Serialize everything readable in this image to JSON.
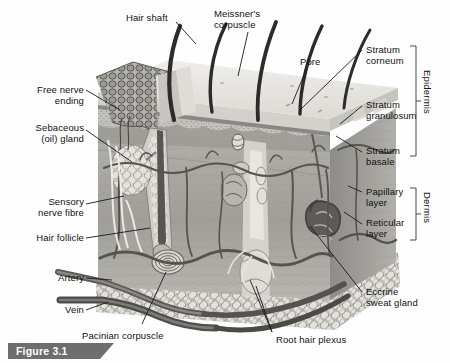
{
  "figure": {
    "caption": "Figure 3.1",
    "style": "grayscale anatomical illustration"
  },
  "colors": {
    "background": "#fefefe",
    "ink": "#1a1a1a",
    "caption_bar": "#6e6e6e",
    "caption_text": "#ffffff",
    "epidermis_top": "#e8e6e2",
    "epidermis_mid": "#b9b7b2",
    "epidermis_dark": "#8e8c88",
    "dermis": "#a8a6a1",
    "dermis_light": "#c9c7c2",
    "hypodermis": "#d6d4cf",
    "vessel_dark": "#5a5854",
    "hair": "#2e2c2a"
  },
  "labels_left": [
    {
      "id": "free-nerve-ending",
      "text": "Free nerve\nending",
      "x": 12,
      "y": 86,
      "w": 72
    },
    {
      "id": "sebaceous-gland",
      "text": "Sebaceous\n(oil) gland",
      "x": 8,
      "y": 124,
      "w": 76
    },
    {
      "id": "sensory-nerve-fibre",
      "text": "Sensory\nnerve fibre",
      "x": 8,
      "y": 198,
      "w": 76
    },
    {
      "id": "hair-follicle",
      "text": "Hair follicle",
      "x": 8,
      "y": 232,
      "w": 76
    },
    {
      "id": "artery",
      "text": "Artery",
      "x": 18,
      "y": 272,
      "w": 66
    },
    {
      "id": "vein",
      "text": "Vein",
      "x": 28,
      "y": 304,
      "w": 56
    }
  ],
  "labels_top": [
    {
      "id": "hair-shaft",
      "text": "Hair shaft",
      "x": 126,
      "y": 10,
      "w": 60
    },
    {
      "id": "meissners-corpuscle",
      "text": "Meissner's\ncorpuscle",
      "x": 215,
      "y": 8,
      "w": 66
    },
    {
      "id": "pore",
      "text": "Pore",
      "x": 299,
      "y": 55,
      "w": 30
    }
  ],
  "labels_right": [
    {
      "id": "stratum-corneum",
      "text": "Stratum\ncorneum",
      "x": 366,
      "y": 44
    },
    {
      "id": "stratum-granulosum",
      "text": "Stratum\ngranulosum",
      "x": 366,
      "y": 99
    },
    {
      "id": "stratum-basale",
      "text": "Stratum\nbasale",
      "x": 366,
      "y": 145
    },
    {
      "id": "papillary-layer",
      "text": "Papillary\nlayer",
      "x": 366,
      "y": 187
    },
    {
      "id": "reticular-layer",
      "text": "Reticular\nlayer",
      "x": 366,
      "y": 218
    },
    {
      "id": "eccrine-sweat-gland",
      "text": "Eccrine\nsweat gland",
      "x": 366,
      "y": 287
    }
  ],
  "labels_bottom": [
    {
      "id": "pacinian-corpuscle",
      "text": "Pacinian corpuscle",
      "x": 82,
      "y": 329
    },
    {
      "id": "root-hair-plexus",
      "text": "Root hair plexus",
      "x": 276,
      "y": 334
    }
  ],
  "brackets": [
    {
      "id": "epidermis",
      "label": "Epidermis",
      "x": 414,
      "y_top": 44,
      "y_bottom": 158,
      "text_x": 424,
      "text_y": 70
    },
    {
      "id": "dermis",
      "label": "Dermis",
      "x": 414,
      "y_top": 186,
      "y_bottom": 240,
      "text_x": 424,
      "text_y": 193
    }
  ],
  "structures": [
    "hair shaft",
    "hair follicle",
    "sebaceous (oil) gland",
    "free nerve ending",
    "Meissner's corpuscle",
    "Pacinian corpuscle",
    "eccrine sweat gland",
    "pore",
    "sensory nerve fibre",
    "root hair plexus",
    "artery",
    "vein",
    "stratum corneum",
    "stratum granulosum",
    "stratum basale",
    "papillary layer",
    "reticular layer",
    "epidermis",
    "dermis",
    "subcutaneous fat"
  ]
}
